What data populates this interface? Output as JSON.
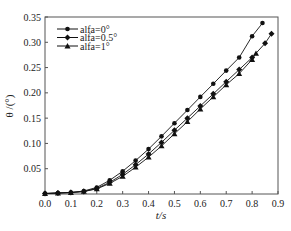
{
  "chart_data": {
    "type": "line",
    "title": "",
    "xlabel": "t/s",
    "ylabel": "θ /(°)",
    "xlim": [
      0.0,
      0.9
    ],
    "ylim": [
      0.0,
      0.35
    ],
    "xticks": [
      "0.0",
      "0.1",
      "0.2",
      "0.3",
      "0.4",
      "0.5",
      "0.6",
      "0.7",
      "0.8",
      "0.9"
    ],
    "yticks": [
      "0.05",
      "0.10",
      "0.15",
      "0.20",
      "0.25",
      "0.30",
      "0.35"
    ],
    "grid": false,
    "legend_position": "upper left",
    "series": [
      {
        "name": "alfa=0°",
        "marker": "circle",
        "x": [
          0.0,
          0.05,
          0.1,
          0.15,
          0.2,
          0.25,
          0.3,
          0.35,
          0.4,
          0.45,
          0.5,
          0.55,
          0.6,
          0.65,
          0.7,
          0.75,
          0.8,
          0.84
        ],
        "y": [
          0.001,
          0.002,
          0.003,
          0.006,
          0.013,
          0.027,
          0.045,
          0.066,
          0.089,
          0.114,
          0.14,
          0.166,
          0.192,
          0.218,
          0.244,
          0.27,
          0.312,
          0.338
        ]
      },
      {
        "name": "alfa=0.5°",
        "marker": "diamond",
        "x": [
          0.0,
          0.05,
          0.1,
          0.15,
          0.2,
          0.25,
          0.3,
          0.35,
          0.4,
          0.45,
          0.5,
          0.55,
          0.6,
          0.65,
          0.7,
          0.75,
          0.8,
          0.85,
          0.875
        ],
        "y": [
          0.001,
          0.002,
          0.003,
          0.005,
          0.011,
          0.023,
          0.039,
          0.058,
          0.079,
          0.102,
          0.126,
          0.15,
          0.174,
          0.198,
          0.222,
          0.246,
          0.27,
          0.298,
          0.317
        ]
      },
      {
        "name": "alfa=1°",
        "marker": "triangle",
        "x": [
          0.0,
          0.05,
          0.1,
          0.15,
          0.2,
          0.25,
          0.3,
          0.35,
          0.4,
          0.45,
          0.5,
          0.55,
          0.6,
          0.65,
          0.7,
          0.75,
          0.8,
          0.815
        ],
        "y": [
          0.001,
          0.002,
          0.003,
          0.005,
          0.01,
          0.021,
          0.035,
          0.053,
          0.073,
          0.095,
          0.119,
          0.143,
          0.168,
          0.192,
          0.216,
          0.238,
          0.266,
          0.278
        ]
      }
    ]
  }
}
